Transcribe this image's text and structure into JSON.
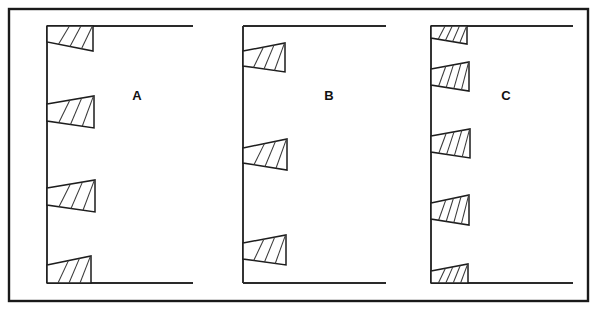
{
  "figure": {
    "kind": "line-drawing",
    "background_color": "#ffffff",
    "ink_color": "#1a1a1a",
    "canvas": {
      "width": 598,
      "height": 314
    },
    "border": {
      "x": 9,
      "y": 9,
      "width": 579,
      "height": 292,
      "stroke_width": 2.4
    }
  },
  "panels": [
    {
      "label": "A",
      "label_x": 137,
      "label_y": 97,
      "axis_x": 47,
      "axis_top_y": 26,
      "axis_bottom_y": 283,
      "top_rule": {
        "x1": 47,
        "x2": 193,
        "y": 26
      },
      "bottom_rule": {
        "x1": 47,
        "x2": 193,
        "y": 283
      },
      "wedge_count": 4,
      "wedges": [
        {
          "root_top_y": 26,
          "root_bottom_y": 42,
          "tip_x": 93,
          "tip_top_y": 26,
          "tip_bottom_y": 51,
          "hatch_count": 3,
          "flush": "top"
        },
        {
          "root_top_y": 104,
          "root_bottom_y": 121,
          "tip_x": 94,
          "tip_top_y": 96,
          "tip_bottom_y": 128,
          "hatch_count": 3,
          "flush": "none"
        },
        {
          "root_top_y": 188,
          "root_bottom_y": 205,
          "tip_x": 95,
          "tip_top_y": 180,
          "tip_bottom_y": 212,
          "hatch_count": 3,
          "flush": "none"
        },
        {
          "root_top_y": 265,
          "root_bottom_y": 283,
          "tip_x": 91,
          "tip_top_y": 256,
          "tip_bottom_y": 283,
          "hatch_count": 3,
          "flush": "bottom"
        }
      ]
    },
    {
      "label": "B",
      "label_x": 329,
      "label_y": 97,
      "axis_x": 243,
      "axis_top_y": 26,
      "axis_bottom_y": 283,
      "top_rule": {
        "x1": 243,
        "x2": 386,
        "y": 26
      },
      "bottom_rule": {
        "x1": 243,
        "x2": 386,
        "y": 283
      },
      "wedge_count": 3,
      "wedges": [
        {
          "root_top_y": 51,
          "root_bottom_y": 66,
          "tip_x": 285,
          "tip_top_y": 43,
          "tip_bottom_y": 72,
          "hatch_count": 3,
          "flush": "none"
        },
        {
          "root_top_y": 148,
          "root_bottom_y": 163,
          "tip_x": 287,
          "tip_top_y": 139,
          "tip_bottom_y": 170,
          "hatch_count": 3,
          "flush": "none"
        },
        {
          "root_top_y": 243,
          "root_bottom_y": 259,
          "tip_x": 286,
          "tip_top_y": 235,
          "tip_bottom_y": 265,
          "hatch_count": 3,
          "flush": "none"
        }
      ]
    },
    {
      "label": "C",
      "label_x": 506,
      "label_y": 97,
      "axis_x": 431,
      "axis_top_y": 26,
      "axis_bottom_y": 283,
      "top_rule": {
        "x1": 431,
        "x2": 573,
        "y": 26
      },
      "bottom_rule": {
        "x1": 431,
        "x2": 573,
        "y": 283
      },
      "wedge_count": 5,
      "wedges": [
        {
          "root_top_y": 26,
          "root_bottom_y": 38,
          "tip_x": 467,
          "tip_top_y": 26,
          "tip_bottom_y": 44,
          "hatch_count": 4,
          "flush": "top"
        },
        {
          "root_top_y": 69,
          "root_bottom_y": 85,
          "tip_x": 469,
          "tip_top_y": 62,
          "tip_bottom_y": 91,
          "hatch_count": 4,
          "flush": "none"
        },
        {
          "root_top_y": 136,
          "root_bottom_y": 152,
          "tip_x": 470,
          "tip_top_y": 129,
          "tip_bottom_y": 158,
          "hatch_count": 4,
          "flush": "none"
        },
        {
          "root_top_y": 203,
          "root_bottom_y": 219,
          "tip_x": 469,
          "tip_top_y": 195,
          "tip_bottom_y": 225,
          "hatch_count": 4,
          "flush": "none"
        },
        {
          "root_top_y": 271,
          "root_bottom_y": 283,
          "tip_x": 468,
          "tip_top_y": 264,
          "tip_bottom_y": 283,
          "hatch_count": 4,
          "flush": "bottom"
        }
      ]
    }
  ]
}
